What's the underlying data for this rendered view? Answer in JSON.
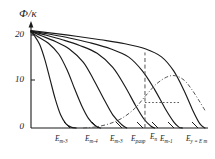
{
  "figure": {
    "type": "line-plot",
    "background": "#ffffff",
    "ink_color": "#1a1a1a"
  },
  "axes": {
    "y_title": "Ф/к",
    "x_title": "",
    "y_ticks": [
      {
        "value": 20,
        "label": "20"
      },
      {
        "value": 10,
        "label": "10"
      },
      {
        "value": 0,
        "label": "0"
      }
    ],
    "ylim": [
      0,
      23
    ],
    "xlim": [
      0,
      1
    ],
    "grid": false,
    "y_arrow": true
  },
  "chart_data": {
    "type": "line",
    "title": "",
    "xlabel": "",
    "ylabel": "Ф/к",
    "ylim": [
      0,
      23
    ],
    "xlim": [
      0,
      1
    ],
    "grid": false,
    "legend": "none",
    "x_tick_labels": [
      {
        "base": "E",
        "sub": "m-3",
        "label": "E m-3"
      },
      {
        "base": "E",
        "sub": "m-4",
        "label": "E m-4"
      },
      {
        "base": "E",
        "sub": "m-3",
        "label": "E m-3"
      },
      {
        "base": "E",
        "sub": "разр",
        "label": "E разр"
      },
      {
        "base": "E",
        "sub": "n",
        "label": "E n"
      },
      {
        "base": "E",
        "sub": "m-1",
        "label": "E m-1"
      },
      {
        "base": "E",
        "sub": "у = E m",
        "label": "E у = E m"
      }
    ],
    "series": [
      {
        "name": "curve-1",
        "style": "solid",
        "points": [
          [
            0.0,
            21.8
          ],
          [
            0.02,
            21.0
          ],
          [
            0.05,
            19.0
          ],
          [
            0.08,
            15.5
          ],
          [
            0.11,
            11.0
          ],
          [
            0.14,
            6.5
          ],
          [
            0.17,
            3.0
          ],
          [
            0.2,
            1.0
          ],
          [
            0.23,
            0.2
          ],
          [
            0.26,
            0.0
          ]
        ]
      },
      {
        "name": "curve-2",
        "style": "solid",
        "points": [
          [
            0.0,
            21.9
          ],
          [
            0.04,
            20.8
          ],
          [
            0.1,
            19.3
          ],
          [
            0.16,
            16.8
          ],
          [
            0.21,
            13.0
          ],
          [
            0.25,
            9.0
          ],
          [
            0.29,
            5.2
          ],
          [
            0.33,
            2.2
          ],
          [
            0.37,
            0.5
          ],
          [
            0.4,
            0.0
          ]
        ]
      },
      {
        "name": "curve-3",
        "style": "solid",
        "points": [
          [
            0.0,
            22.0
          ],
          [
            0.06,
            21.0
          ],
          [
            0.14,
            19.7
          ],
          [
            0.22,
            18.0
          ],
          [
            0.3,
            15.0
          ],
          [
            0.36,
            11.0
          ],
          [
            0.42,
            6.5
          ],
          [
            0.47,
            3.0
          ],
          [
            0.52,
            0.8
          ],
          [
            0.55,
            0.0
          ]
        ]
      },
      {
        "name": "curve-4",
        "style": "solid",
        "points": [
          [
            0.0,
            22.0
          ],
          [
            0.08,
            21.2
          ],
          [
            0.18,
            20.1
          ],
          [
            0.28,
            18.8
          ],
          [
            0.38,
            17.0
          ],
          [
            0.47,
            13.8
          ],
          [
            0.54,
            9.5
          ],
          [
            0.6,
            5.2
          ],
          [
            0.65,
            2.0
          ],
          [
            0.69,
            0.4
          ],
          [
            0.71,
            0.0
          ]
        ]
      },
      {
        "name": "curve-5",
        "style": "solid",
        "points": [
          [
            0.0,
            22.1
          ],
          [
            0.1,
            21.4
          ],
          [
            0.22,
            20.5
          ],
          [
            0.34,
            19.4
          ],
          [
            0.46,
            18.0
          ],
          [
            0.56,
            16.2
          ],
          [
            0.64,
            13.0
          ],
          [
            0.71,
            8.8
          ],
          [
            0.77,
            4.5
          ],
          [
            0.82,
            1.4
          ],
          [
            0.85,
            0.2
          ],
          [
            0.87,
            0.0
          ]
        ]
      },
      {
        "name": "curve-6",
        "style": "solid",
        "points": [
          [
            0.0,
            22.2
          ],
          [
            0.12,
            21.6
          ],
          [
            0.26,
            20.9
          ],
          [
            0.4,
            20.1
          ],
          [
            0.54,
            19.2
          ],
          [
            0.66,
            18.0
          ],
          [
            0.75,
            16.2
          ],
          [
            0.82,
            13.0
          ],
          [
            0.88,
            8.5
          ],
          [
            0.93,
            4.0
          ],
          [
            0.97,
            1.0
          ],
          [
            1.0,
            0.0
          ]
        ]
      }
    ],
    "annotations": [
      {
        "name": "vertical-dashed-line",
        "style": "dashed",
        "x": 0.655,
        "y_from": 0.0,
        "y_to": 17.2
      },
      {
        "name": "horizontal-dotted-line",
        "style": "dotted",
        "y": 5.8,
        "x_from": 0.655,
        "x_to": 0.86
      },
      {
        "name": "distribution-bell-curve",
        "style": "dash-dot",
        "points": [
          [
            0.3,
            0.0
          ],
          [
            0.38,
            0.3
          ],
          [
            0.46,
            1.1
          ],
          [
            0.53,
            2.4
          ],
          [
            0.6,
            4.6
          ],
          [
            0.66,
            7.4
          ],
          [
            0.72,
            10.0
          ],
          [
            0.78,
            11.6
          ],
          [
            0.83,
            11.9
          ],
          [
            0.88,
            10.9
          ],
          [
            0.92,
            9.0
          ],
          [
            0.96,
            6.6
          ],
          [
            1.0,
            4.0
          ]
        ]
      }
    ]
  }
}
